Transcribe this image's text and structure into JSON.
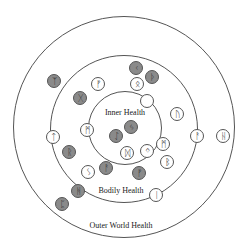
{
  "diagram": {
    "rings": [
      {
        "name": "outer-world",
        "cx": 124,
        "cy": 127,
        "r": 111
      },
      {
        "name": "bodily",
        "cx": 124,
        "cy": 129,
        "r": 74
      },
      {
        "name": "inner",
        "cx": 125,
        "cy": 128,
        "r": 37
      }
    ],
    "labels": {
      "inner": "Inner Health",
      "bodily": "Bodily Health",
      "outer": "Outer World Health"
    },
    "runes": [
      {
        "id": "algiz",
        "glyph": "ᛉ",
        "filled": true,
        "x": 54,
        "y": 81
      },
      {
        "id": "fehu-1",
        "glyph": "ᚠ",
        "filled": false,
        "x": 98,
        "y": 84
      },
      {
        "id": "kenaz",
        "glyph": "ᚲ",
        "filled": true,
        "x": 136,
        "y": 68
      },
      {
        "id": "thurisaz",
        "glyph": "ᚦ",
        "filled": true,
        "x": 152,
        "y": 77
      },
      {
        "id": "othala",
        "glyph": "ᛟ",
        "filled": false,
        "x": 137,
        "y": 84
      },
      {
        "id": "gebo",
        "glyph": "ᚷ",
        "filled": true,
        "x": 80,
        "y": 98
      },
      {
        "id": "blank",
        "glyph": "",
        "filled": false,
        "x": 147,
        "y": 101
      },
      {
        "id": "uruz",
        "glyph": "ᚢ",
        "filled": false,
        "x": 177,
        "y": 114
      },
      {
        "id": "mannaz-1",
        "glyph": "ᛗ",
        "filled": false,
        "x": 87,
        "y": 130
      },
      {
        "id": "jera",
        "glyph": "ᛃ",
        "filled": true,
        "x": 131,
        "y": 127
      },
      {
        "id": "eihwaz",
        "glyph": "ᛇ",
        "filled": true,
        "x": 116,
        "y": 136
      },
      {
        "id": "tiwaz",
        "glyph": "ᛏ",
        "filled": false,
        "x": 53,
        "y": 137
      },
      {
        "id": "ansuz",
        "glyph": "ᚨ",
        "filled": false,
        "x": 197,
        "y": 136
      },
      {
        "id": "hagalaz",
        "glyph": "ᚺ",
        "filled": false,
        "x": 223,
        "y": 136
      },
      {
        "id": "dagaz",
        "glyph": "ᛞ",
        "filled": false,
        "x": 127,
        "y": 153
      },
      {
        "id": "ingwaz",
        "glyph": "ᛜ",
        "filled": false,
        "x": 147,
        "y": 151
      },
      {
        "id": "mannaz-2",
        "glyph": "ᛗ",
        "filled": false,
        "x": 163,
        "y": 144
      },
      {
        "id": "raidho",
        "glyph": "ᚱ",
        "filled": true,
        "x": 69,
        "y": 152
      },
      {
        "id": "berkano",
        "glyph": "ᛒ",
        "filled": false,
        "x": 167,
        "y": 162
      },
      {
        "id": "sowilo",
        "glyph": "ᛊ",
        "filled": false,
        "x": 88,
        "y": 172
      },
      {
        "id": "ansuz-2",
        "glyph": "ᚨ",
        "filled": true,
        "x": 106,
        "y": 168
      },
      {
        "id": "fehu-2",
        "glyph": "ᚠ",
        "filled": true,
        "x": 139,
        "y": 173
      },
      {
        "id": "hagalaz-2",
        "glyph": "ᚻ",
        "filled": true,
        "x": 78,
        "y": 191
      },
      {
        "id": "isa",
        "glyph": "ᛁ",
        "filled": false,
        "x": 156,
        "y": 195
      },
      {
        "id": "perthro",
        "glyph": "ᛈ",
        "filled": true,
        "x": 62,
        "y": 204
      }
    ]
  }
}
